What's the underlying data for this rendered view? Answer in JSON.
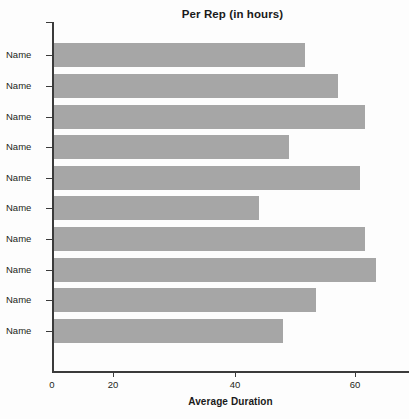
{
  "chart_data": {
    "type": "bar",
    "orientation": "horizontal",
    "title": "Per Rep (in hours)",
    "xlabel": "Average Duration",
    "ylabel": "",
    "categories": [
      "Name",
      "Name",
      "Name",
      "Name",
      "Name",
      "Name",
      "Name",
      "Name",
      "Name",
      "Name"
    ],
    "values": [
      46,
      52,
      57,
      43,
      56,
      37.5,
      57,
      59,
      48,
      42
    ],
    "xlim": [
      0,
      65
    ],
    "xticks": [
      0,
      20,
      40,
      60
    ],
    "xtick_labels": [
      "0",
      "20",
      "40",
      "60"
    ],
    "grid": false,
    "legend": false,
    "bar_color": "#a6a6a6",
    "axis_color": "#3b3b3b",
    "text_color": "#231f20",
    "background": "#ffffff"
  }
}
